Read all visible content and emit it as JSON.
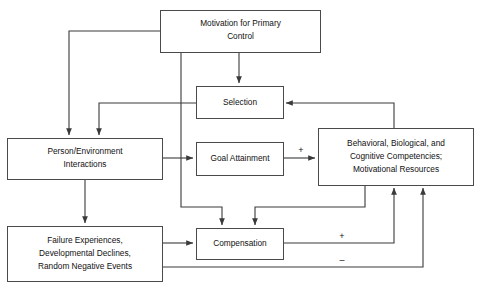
{
  "diagram": {
    "background_color": "#ffffff",
    "line_color": "#3a3a3a",
    "box_stroke_color": "#4a4a4a",
    "box_fill_color": "#ffffff",
    "text_color": "#111111",
    "nodes": [
      {
        "id": "motivation",
        "lines": [
          "Motivation for Primary",
          "Control"
        ],
        "x": 160,
        "y": 10,
        "w": 160,
        "h": 42
      },
      {
        "id": "selection",
        "lines": [
          "Selection"
        ],
        "x": 196,
        "y": 86,
        "w": 87,
        "h": 32
      },
      {
        "id": "person-environment",
        "lines": [
          "Person/Environment",
          "Interactions"
        ],
        "x": 7,
        "y": 138,
        "w": 155,
        "h": 41
      },
      {
        "id": "goal-attainment",
        "lines": [
          "Goal Attainment"
        ],
        "x": 196,
        "y": 142,
        "w": 87,
        "h": 33
      },
      {
        "id": "competencies",
        "lines": [
          "Behavioral, Biological, and",
          "Cognitive Competencies;",
          "Motivational Resources"
        ],
        "x": 318,
        "y": 128,
        "w": 155,
        "h": 57
      },
      {
        "id": "failure-experiences",
        "lines": [
          "Failure Experiences,",
          "Developmental Declines,",
          "Random Negative Events"
        ],
        "x": 7,
        "y": 226,
        "w": 155,
        "h": 55
      },
      {
        "id": "compensation",
        "lines": [
          "Compensation"
        ],
        "x": 196,
        "y": 228,
        "w": 87,
        "h": 31
      }
    ],
    "sign_labels": [
      {
        "id": "plus-goal-to-competencies",
        "text": "+",
        "x": 301,
        "y": 153
      },
      {
        "id": "plus-compensation-to-competencies",
        "text": "+",
        "x": 342,
        "y": 236
      },
      {
        "id": "minus-failure-to-competencies",
        "text": "–",
        "x": 342,
        "y": 260
      }
    ],
    "edges": [
      {
        "id": "motivation-to-selection",
        "from": "motivation",
        "to": "selection",
        "sign": ""
      },
      {
        "id": "motivation-to-person-environment",
        "from": "motivation",
        "to": "person-environment",
        "sign": ""
      },
      {
        "id": "motivation-to-compensation",
        "from": "motivation",
        "to": "compensation",
        "sign": ""
      },
      {
        "id": "selection-to-person-environment",
        "from": "selection",
        "to": "person-environment",
        "sign": ""
      },
      {
        "id": "person-environment-to-goal-attainment",
        "from": "person-environment",
        "to": "goal-attainment",
        "sign": ""
      },
      {
        "id": "person-environment-to-failure-experiences",
        "from": "person-environment",
        "to": "failure-experiences",
        "sign": ""
      },
      {
        "id": "goal-attainment-to-competencies",
        "from": "goal-attainment",
        "to": "competencies",
        "sign": "+"
      },
      {
        "id": "competencies-to-selection",
        "from": "competencies",
        "to": "selection",
        "sign": ""
      },
      {
        "id": "competencies-to-compensation",
        "from": "competencies",
        "to": "compensation",
        "sign": ""
      },
      {
        "id": "failure-experiences-to-compensation",
        "from": "failure-experiences",
        "to": "compensation",
        "sign": ""
      },
      {
        "id": "compensation-to-competencies",
        "from": "compensation",
        "to": "competencies",
        "sign": "+"
      },
      {
        "id": "failure-experiences-to-competencies",
        "from": "failure-experiences",
        "to": "competencies",
        "sign": "–"
      }
    ]
  }
}
